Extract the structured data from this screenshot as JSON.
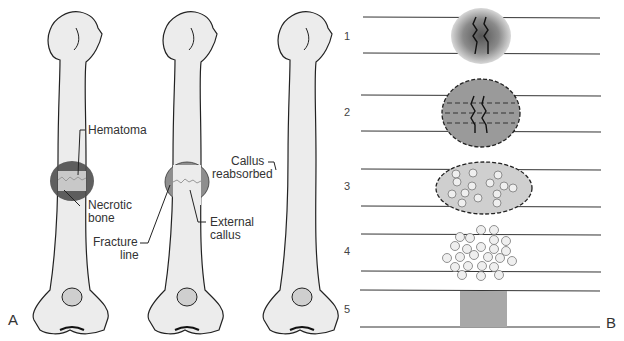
{
  "panel_a": {
    "letter": "A",
    "labels": {
      "hematoma": "Hematoma",
      "necrotic_bone_1": "Necrotic",
      "necrotic_bone_2": "bone",
      "fracture_line_1": "Fracture",
      "fracture_line_2": "line",
      "external_callus_1": "External",
      "external_callus_2": "callus",
      "callus_reabsorbed_1": "Callus",
      "callus_reabsorbed_2": "reabsorbed"
    }
  },
  "panel_b": {
    "letter": "B",
    "stages": [
      "1",
      "2",
      "3",
      "4",
      "5"
    ]
  },
  "colors": {
    "bone_fill": "#ececec",
    "outline": "#222222",
    "hematoma_dark": "#5a5a5a",
    "callus_mid": "#8f8f8f",
    "stage5_fill": "#a8a8a8"
  }
}
